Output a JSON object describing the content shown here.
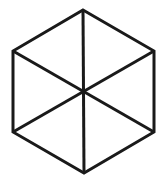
{
  "diagram": {
    "shape": "hexagon-with-diagonals",
    "stroke_color": "#1a1a1a",
    "background": "#ffffff",
    "stroke_width": 3,
    "vertices": {
      "top": [
        83,
        10
      ],
      "upper_right": [
        154,
        51
      ],
      "lower_right": [
        154,
        132
      ],
      "bottom": [
        84,
        173
      ],
      "lower_left": [
        13,
        132
      ],
      "upper_left": [
        13,
        51
      ]
    },
    "center": [
      84,
      92
    ]
  }
}
